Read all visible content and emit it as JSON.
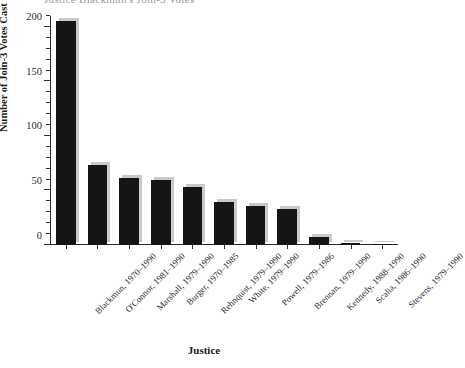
{
  "figure": {
    "clipped_title": "Justice Blackmun's Join-3 Votes",
    "xlabel": "Justice",
    "ylabel": "Number of Join-3 Votes Cast"
  },
  "colors": {
    "bar": "#151515",
    "bar_shadow": "#c9c9c9",
    "axis": "#2b2b2b",
    "background": "#ffffff"
  },
  "chart_data": {
    "type": "bar",
    "title": "Justice Blackmun's Join-3 Votes",
    "xlabel": "Justice",
    "ylabel": "Number of Join-3 Votes Cast",
    "ylim": [
      0,
      210
    ],
    "yticks": [
      0,
      50,
      100,
      150,
      200
    ],
    "ytick_labels": [
      "0",
      "50",
      "100",
      "150",
      "200"
    ],
    "minor_tick_step": 10,
    "grid": false,
    "legend": null,
    "categories": [
      "Blackmun, 1970–1990",
      "O'Connor, 1981–1990",
      "Marshall, 1979–1990",
      "Burger, 1970–1985",
      "Rehnquist, 1979–1990",
      "White, 1979–1990",
      "Powell, 1979–1986",
      "Brennan, 1979–1990",
      "Kennedy, 1988–1990",
      "Scalia, 1986–1990",
      "Stevens, 1979–1990"
    ],
    "values": [
      205,
      73,
      61,
      60,
      53,
      39,
      36,
      33,
      7,
      2,
      1
    ]
  }
}
